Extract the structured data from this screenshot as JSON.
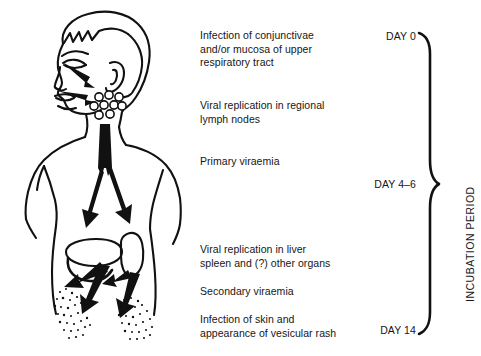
{
  "diagram": {
    "type": "pathogenesis-flow",
    "ink_color": "#111111",
    "background_color": "#ffffff"
  },
  "stages": [
    {
      "id": "stage-1",
      "text": "Infection of conjunctivae\nand/or mucosa of upper\nrespiratory tract",
      "x": 200,
      "y": 29
    },
    {
      "id": "stage-2",
      "text": "Viral replication in regional\nlymph nodes",
      "x": 200,
      "y": 99
    },
    {
      "id": "stage-3",
      "text": "Primary viraemia",
      "x": 200,
      "y": 155
    },
    {
      "id": "stage-4",
      "text": "Viral replication in liver\nspleen and (?) other organs",
      "x": 200,
      "y": 243
    },
    {
      "id": "stage-5",
      "text": "Secondary viraemia",
      "x": 200,
      "y": 285
    },
    {
      "id": "stage-6",
      "text": "Infection of skin and\nappearance of vesicular rash",
      "x": 200,
      "y": 313
    }
  ],
  "timeline": {
    "period_label": "INCUBATION PERIOD",
    "days": [
      {
        "id": "day-0",
        "label": "DAY 0",
        "y": 30
      },
      {
        "id": "day-4-6",
        "label": "DAY 4–6",
        "y": 178
      },
      {
        "id": "day-14",
        "label": "DAY 14",
        "y": 324
      }
    ],
    "brace": {
      "top_y": 36,
      "mid_y": 185,
      "bottom_y": 331,
      "x": 424
    }
  },
  "anatomy": {
    "parts": [
      {
        "name": "head",
        "description": "head in three-quarter profile facing left"
      },
      {
        "name": "eye",
        "description": "conjunctiva entry point"
      },
      {
        "name": "nose-mouth",
        "description": "upper respiratory mucosa entry point"
      },
      {
        "name": "lymph-nodes",
        "description": "cluster of nine small circles at neck",
        "count": 9
      },
      {
        "name": "torso",
        "description": "shoulders, arms and trunk outline"
      },
      {
        "name": "bloodstream",
        "description": "thick vertical arrow descending through trunk"
      },
      {
        "name": "liver",
        "description": "wide horizontal oval organ, left of midline"
      },
      {
        "name": "spleen",
        "description": "narrow vertical oval organ, right of midline"
      },
      {
        "name": "rash-left",
        "description": "stippled vesicular rash on left hip"
      },
      {
        "name": "rash-right",
        "description": "stippled vesicular rash on right hip"
      }
    ]
  }
}
